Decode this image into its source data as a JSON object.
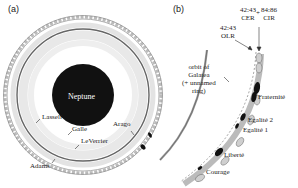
{
  "panels": {
    "a": {
      "label": "(a)",
      "planet": "Neptune",
      "rings": [
        "Lassell",
        "Galle",
        "LeVerrier",
        "Arago",
        "Adams"
      ]
    },
    "b": {
      "label": "(b)",
      "resonances": {
        "olr": {
          "line1": "42:43",
          "line2": "OLR"
        },
        "cer": {
          "line1": "42:43",
          "line2": "CER"
        },
        "plus": "+",
        "cir": {
          "line1": "84:86",
          "line2": "CIR"
        }
      },
      "orbit_label": {
        "line1": "orbit of",
        "line2": "Galatea",
        "line3": "(+ unnamed",
        "line4": "ring)"
      },
      "arcs": [
        "Fraternité",
        "Egalité 2",
        "Egalité 1",
        "Liberté",
        "Courage"
      ]
    }
  },
  "colors": {
    "planet": "#111111",
    "ring_light": "#d9d9d9",
    "ring_dark": "#555555",
    "arc_fill": "#cfcfcf",
    "arc_dark": "#111111"
  }
}
